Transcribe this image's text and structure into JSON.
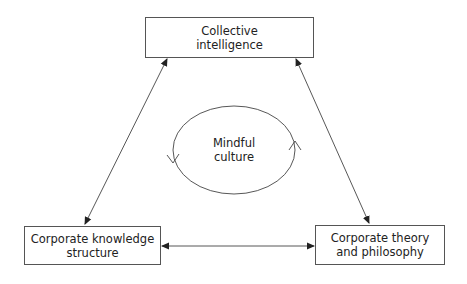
{
  "diagram": {
    "nodes": {
      "top": {
        "line1": "Collective",
        "line2": "intelligence"
      },
      "bottom_left": {
        "line1": "Corporate knowledge",
        "line2": "structure"
      },
      "bottom_right": {
        "line1": "Corporate theory",
        "line2": "and philosophy"
      }
    },
    "center": {
      "line1": "Mindful",
      "line2": "culture"
    },
    "edges": [
      {
        "from": "Collective intelligence",
        "to": "Corporate knowledge structure",
        "type": "bidirectional"
      },
      {
        "from": "Collective intelligence",
        "to": "Corporate theory and philosophy",
        "type": "bidirectional"
      },
      {
        "from": "Corporate knowledge structure",
        "to": "Corporate theory and philosophy",
        "type": "bidirectional"
      }
    ],
    "cycle": {
      "label": "Mindful culture",
      "shape": "ellipse",
      "arrows": [
        "left-down",
        "right-up"
      ]
    },
    "colors": {
      "line": "#333333",
      "box_border": "#555555",
      "background": "#ffffff"
    }
  }
}
